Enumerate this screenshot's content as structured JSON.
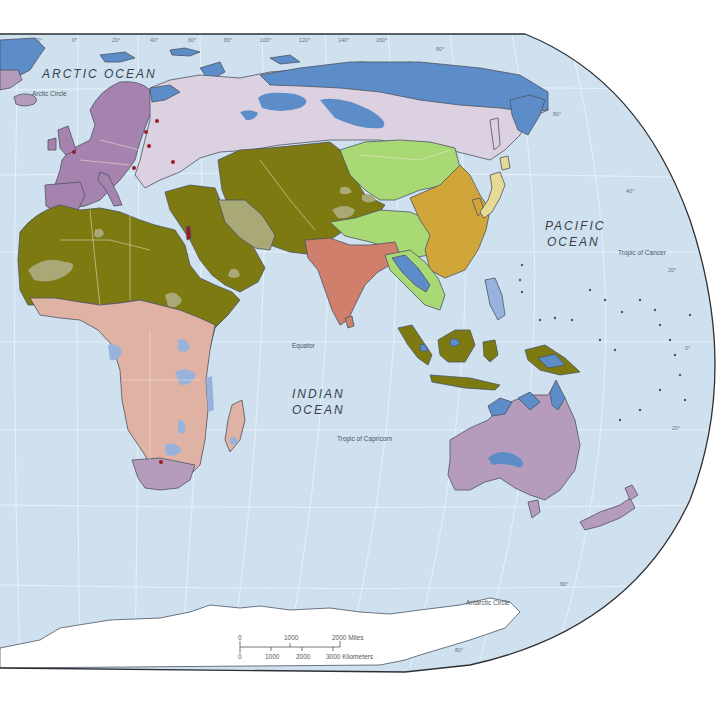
{
  "map": {
    "oceans": {
      "arctic": "ARCTIC   OCEAN",
      "pacific_line1": "PACIFIC",
      "pacific_line2": "OCEAN",
      "indian_line1": "INDIAN",
      "indian_line2": "OCEAN"
    },
    "reference_lines": {
      "arctic_circle": "Arctic Circle",
      "tropic_of_cancer": "Tropic of Cancer",
      "equator": "Equator",
      "tropic_of_capricorn": "Tropic of Capricorn",
      "antarctic_circle": "Antarctic Circle"
    },
    "longitude_ticks": [
      "20°",
      "0°",
      "20°",
      "40°",
      "60°",
      "80°",
      "100°",
      "120°",
      "140°",
      "160°"
    ],
    "latitude_ticks": {
      "n80_top": "80°",
      "n80_right": "80°",
      "n60": "60°",
      "n40": "40°",
      "n20": "20°",
      "eq": "0°",
      "s20": "20°",
      "s60": "60°",
      "s80_a": "80°",
      "s80_b": "80°"
    },
    "scale_bar": {
      "miles": {
        "labels": [
          "0",
          "1000",
          "2000 Miles"
        ]
      },
      "kilometers": {
        "labels": [
          "0",
          "1000",
          "2000",
          "3000 Kilometers"
        ]
      }
    },
    "colors": {
      "ocean": "#cfe1ee",
      "page": "#ffffff",
      "olive": "#7d7a12",
      "olive_light": "#a9a877",
      "lavender_purple": "#a583ae",
      "pale_lilac": "#dcd1e0",
      "steel_blue": "#5d8dc8",
      "light_blue": "#97b3dd",
      "salmon_pink": "#e0b2a3",
      "terracotta": "#cf7f6c",
      "lime_green": "#a9d975",
      "mustard": "#d0a53a",
      "pale_yellow": "#e7da93",
      "mauve": "#b59cbd",
      "city_dot": "#9c1a22"
    }
  }
}
